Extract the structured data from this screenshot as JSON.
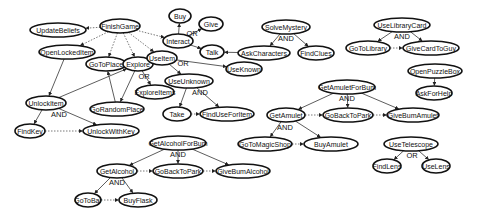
{
  "diagram": {
    "nodes": [
      {
        "id": "FinishGame",
        "label": "FinishGame",
        "x": 120,
        "y": 26,
        "rx": 20
      },
      {
        "id": "UpdateBeliefs",
        "label": "UpdateBeliefs",
        "x": 58,
        "y": 30,
        "rx": 28
      },
      {
        "id": "OpenLockedItem",
        "label": "OpenLockedItem",
        "x": 67,
        "y": 52,
        "rx": 28
      },
      {
        "id": "GoToPlace",
        "label": "GoToPlace",
        "x": 106,
        "y": 64,
        "rx": 20
      },
      {
        "id": "Explore",
        "label": "Explore",
        "x": 138,
        "y": 64,
        "rx": 15
      },
      {
        "id": "ExploreItems",
        "label": "ExploreItems",
        "x": 155,
        "y": 92,
        "rx": 19
      },
      {
        "id": "GoRandomPlace",
        "label": "GoRandomPlace",
        "x": 117,
        "y": 109,
        "rx": 27
      },
      {
        "id": "UnlockItem",
        "label": "UnlockItem",
        "x": 46,
        "y": 103,
        "rx": 20
      },
      {
        "id": "FindKey",
        "label": "FindKey",
        "x": 30,
        "y": 131,
        "rx": 15
      },
      {
        "id": "UnlockWithKey",
        "label": "UnlockWithKey",
        "x": 111,
        "y": 131,
        "rx": 28
      },
      {
        "id": "Buy",
        "label": "Buy",
        "x": 180,
        "y": 16,
        "rx": 11
      },
      {
        "id": "Give",
        "label": "Give",
        "x": 211,
        "y": 24,
        "rx": 12
      },
      {
        "id": "Interact",
        "label": "Interact",
        "x": 178,
        "y": 41,
        "rx": 15
      },
      {
        "id": "Talk",
        "label": "Talk",
        "x": 212,
        "y": 52,
        "rx": 12
      },
      {
        "id": "UseItem",
        "label": "UseItem",
        "x": 162,
        "y": 58,
        "rx": 15
      },
      {
        "id": "UseKnown",
        "label": "UseKnown",
        "x": 244,
        "y": 69,
        "rx": 18
      },
      {
        "id": "UseUnknown",
        "label": "UseUnknown",
        "x": 189,
        "y": 81,
        "rx": 24
      },
      {
        "id": "Take",
        "label": "Take",
        "x": 177,
        "y": 114,
        "rx": 14
      },
      {
        "id": "FindUseForItem",
        "label": "FindUseForItem",
        "x": 227,
        "y": 114,
        "rx": 27
      },
      {
        "id": "SolveMystery",
        "label": "SolveMystery",
        "x": 286,
        "y": 27,
        "rx": 24
      },
      {
        "id": "AskCharacters",
        "label": "AskCharacters",
        "x": 264,
        "y": 53,
        "rx": 26
      },
      {
        "id": "FindClues",
        "label": "FindClues",
        "x": 316,
        "y": 53,
        "rx": 18
      },
      {
        "id": "UseLibraryCard",
        "label": "UseLibraryCard",
        "x": 402,
        "y": 25,
        "rx": 28
      },
      {
        "id": "GoToLibrary",
        "label": "GoToLibrary",
        "x": 368,
        "y": 48,
        "rx": 22
      },
      {
        "id": "GiveCardToGuy",
        "label": "GiveCardToGuy",
        "x": 431,
        "y": 48,
        "rx": 28
      },
      {
        "id": "OpenPuzzleBox",
        "label": "OpenPuzzleBox",
        "x": 435,
        "y": 71,
        "rx": 27
      },
      {
        "id": "AskForHelp",
        "label": "AskForHelp",
        "x": 434,
        "y": 93,
        "rx": 18
      },
      {
        "id": "GetAmuletForBum",
        "label": "GetAmuletForBum",
        "x": 347,
        "y": 87,
        "rx": 28
      },
      {
        "id": "GetAmulet",
        "label": "GetAmulet",
        "x": 286,
        "y": 115,
        "rx": 19
      },
      {
        "id": "GoBackToPark",
        "label": "GoBackToPark",
        "x": 348,
        "y": 115,
        "rx": 25
      },
      {
        "id": "GiveBumAmulet",
        "label": "GiveBumAmulet",
        "x": 413,
        "y": 115,
        "rx": 26
      },
      {
        "id": "GoToMagicShop",
        "label": "GoToMagicShop",
        "x": 265,
        "y": 144,
        "rx": 27
      },
      {
        "id": "BuyAmulet",
        "label": "BuyAmulet",
        "x": 331,
        "y": 144,
        "rx": 27
      },
      {
        "id": "UseTelescope",
        "label": "UseTelescope",
        "x": 411,
        "y": 144,
        "rx": 27
      },
      {
        "id": "FindLens",
        "label": "FindLens",
        "x": 387,
        "y": 166,
        "rx": 14
      },
      {
        "id": "UseLens",
        "label": "UseLens",
        "x": 436,
        "y": 166,
        "rx": 14
      },
      {
        "id": "GetAlcoholForBum",
        "label": "GetAlcoholForBum",
        "x": 178,
        "y": 143,
        "rx": 28
      },
      {
        "id": "GetAlcohol",
        "label": "GetAlcohol",
        "x": 117,
        "y": 171,
        "rx": 20
      },
      {
        "id": "GoBackToPark2",
        "label": "GoBackToPark",
        "x": 178,
        "y": 171,
        "rx": 25
      },
      {
        "id": "GiveBumAlcohol",
        "label": "GiveBumAlcohol",
        "x": 243,
        "y": 171,
        "rx": 27
      },
      {
        "id": "GoToBar",
        "label": "GoToBar",
        "x": 88,
        "y": 200,
        "rx": 13
      },
      {
        "id": "BuyFlask",
        "label": "BuyFlask",
        "x": 138,
        "y": 200,
        "rx": 19
      }
    ],
    "edges": [
      {
        "from": "FinishGame",
        "to": "UpdateBeliefs",
        "style": "dotted"
      },
      {
        "from": "FinishGame",
        "to": "OpenLockedItem",
        "style": "dotted"
      },
      {
        "from": "FinishGame",
        "to": "GoToPlace",
        "style": "dotted"
      },
      {
        "from": "FinishGame",
        "to": "Explore",
        "style": "dotted"
      },
      {
        "from": "FinishGame",
        "to": "UseItem",
        "style": "dotted"
      },
      {
        "from": "FinishGame",
        "to": "Interact",
        "style": "dotted"
      },
      {
        "from": "OpenLockedItem",
        "to": "UnlockItem",
        "style": "solid"
      },
      {
        "from": "Explore",
        "to": "ExploreItems",
        "style": "solid"
      },
      {
        "from": "Explore",
        "to": "GoRandomPlace",
        "style": "solid"
      },
      {
        "from": "GoRandomPlace",
        "to": "GoToPlace",
        "style": "solid"
      },
      {
        "from": "UnlockItem",
        "to": "Explore",
        "style": "solid"
      },
      {
        "from": "UnlockItem",
        "to": "FindKey",
        "style": "solid"
      },
      {
        "from": "UnlockItem",
        "to": "UnlockWithKey",
        "style": "solid"
      },
      {
        "from": "FindKey",
        "to": "UnlockWithKey",
        "style": "dotted"
      },
      {
        "from": "Interact",
        "to": "Buy",
        "style": "solid"
      },
      {
        "from": "Interact",
        "to": "Give",
        "style": "solid"
      },
      {
        "from": "Interact",
        "to": "Talk",
        "style": "solid"
      },
      {
        "from": "UseItem",
        "to": "UseKnown",
        "style": "solid"
      },
      {
        "from": "UseItem",
        "to": "UseUnknown",
        "style": "solid"
      },
      {
        "from": "UseUnknown",
        "to": "Take",
        "style": "solid"
      },
      {
        "from": "UseUnknown",
        "to": "FindUseForItem",
        "style": "solid"
      },
      {
        "from": "Take",
        "to": "FindUseForItem",
        "style": "dotted"
      },
      {
        "from": "SolveMystery",
        "to": "AskCharacters",
        "style": "solid"
      },
      {
        "from": "SolveMystery",
        "to": "FindClues",
        "style": "solid"
      },
      {
        "from": "AskCharacters",
        "to": "Talk",
        "style": "solid"
      },
      {
        "from": "UseLibraryCard",
        "to": "GoToLibrary",
        "style": "solid"
      },
      {
        "from": "UseLibraryCard",
        "to": "GiveCardToGuy",
        "style": "solid"
      },
      {
        "from": "GoToLibrary",
        "to": "GiveCardToGuy",
        "style": "dotted"
      },
      {
        "from": "OpenPuzzleBox",
        "to": "AskForHelp",
        "style": "solid"
      },
      {
        "from": "GetAmuletForBum",
        "to": "GetAmulet",
        "style": "solid"
      },
      {
        "from": "GetAmuletForBum",
        "to": "GoBackToPark",
        "style": "solid"
      },
      {
        "from": "GetAmuletForBum",
        "to": "GiveBumAmulet",
        "style": "solid"
      },
      {
        "from": "GetAmulet",
        "to": "GoBackToPark",
        "style": "dotted"
      },
      {
        "from": "GoBackToPark",
        "to": "GiveBumAmulet",
        "style": "dotted"
      },
      {
        "from": "GetAmulet",
        "to": "GoToMagicShop",
        "style": "solid"
      },
      {
        "from": "GetAmulet",
        "to": "BuyAmulet",
        "style": "solid"
      },
      {
        "from": "GoToMagicShop",
        "to": "BuyAmulet",
        "style": "dotted"
      },
      {
        "from": "UseTelescope",
        "to": "FindLens",
        "style": "solid"
      },
      {
        "from": "UseTelescope",
        "to": "UseLens",
        "style": "solid"
      },
      {
        "from": "GetAlcoholForBum",
        "to": "GetAlcohol",
        "style": "solid"
      },
      {
        "from": "GetAlcoholForBum",
        "to": "GoBackToPark2",
        "style": "solid"
      },
      {
        "from": "GetAlcoholForBum",
        "to": "GiveBumAlcohol",
        "style": "solid"
      },
      {
        "from": "GetAlcohol",
        "to": "GoBackToPark2",
        "style": "dotted"
      },
      {
        "from": "GoBackToPark2",
        "to": "GiveBumAlcohol",
        "style": "dotted"
      },
      {
        "from": "GetAlcohol",
        "to": "GoToBar",
        "style": "solid"
      },
      {
        "from": "GetAlcohol",
        "to": "BuyFlask",
        "style": "solid"
      },
      {
        "from": "GoToBar",
        "to": "BuyFlask",
        "style": "dotted"
      }
    ],
    "labels": [
      {
        "text": "OR",
        "x": 144,
        "y": 76
      },
      {
        "text": "AND",
        "x": 59,
        "y": 114
      },
      {
        "text": "OR",
        "x": 192,
        "y": 33
      },
      {
        "text": "OR",
        "x": 183,
        "y": 63
      },
      {
        "text": "AND",
        "x": 200,
        "y": 92
      },
      {
        "text": "AND",
        "x": 286,
        "y": 38
      },
      {
        "text": "AND",
        "x": 402,
        "y": 36
      },
      {
        "text": "AND",
        "x": 347,
        "y": 98
      },
      {
        "text": "AND",
        "x": 285,
        "y": 127
      },
      {
        "text": "OR",
        "x": 412,
        "y": 155
      },
      {
        "text": "AND",
        "x": 178,
        "y": 154
      },
      {
        "text": "AND",
        "x": 117,
        "y": 182
      }
    ]
  }
}
